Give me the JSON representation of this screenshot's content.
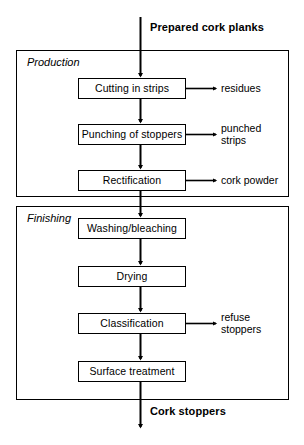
{
  "diagram": {
    "type": "flowchart",
    "background_color": "#ffffff",
    "line_color": "#000000",
    "box_fill": "#ffffff",
    "inputs": [
      {
        "id": "input-planks",
        "label": "Prepared cork planks"
      }
    ],
    "outputs": [
      {
        "id": "output-stoppers",
        "label": "Cork stoppers"
      }
    ],
    "groups": [
      {
        "id": "group-production",
        "label": "Production"
      },
      {
        "id": "group-finishing",
        "label": "Finishing"
      }
    ],
    "steps": [
      {
        "id": "step-cutting",
        "label": "Cutting in strips",
        "group": "group-production"
      },
      {
        "id": "step-punching",
        "label": "Punching of stoppers",
        "group": "group-production"
      },
      {
        "id": "step-rectification",
        "label": "Rectification",
        "group": "group-production"
      },
      {
        "id": "step-washing",
        "label": "Washing/bleaching",
        "group": "group-finishing"
      },
      {
        "id": "step-drying",
        "label": "Drying",
        "group": "group-finishing"
      },
      {
        "id": "step-classification",
        "label": "Classification",
        "group": "group-finishing"
      },
      {
        "id": "step-surface",
        "label": "Surface treatment",
        "group": "group-finishing"
      }
    ],
    "by_products": [
      {
        "id": "byproduct-residues",
        "label": "residues",
        "from": "step-cutting"
      },
      {
        "id": "byproduct-punched-strips",
        "label": "punched\nstrips",
        "from": "step-punching"
      },
      {
        "id": "byproduct-cork-powder",
        "label": "cork powder",
        "from": "step-rectification"
      },
      {
        "id": "byproduct-refuse-stoppers",
        "label": "refuse\nstoppers",
        "from": "step-classification"
      }
    ]
  }
}
